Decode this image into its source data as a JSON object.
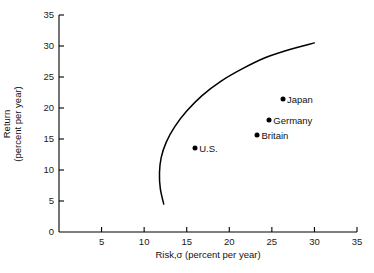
{
  "chart_data": {
    "type": "scatter",
    "title": "",
    "xlabel": "Risk,σ (percent per year)",
    "ylabel_line1": "Return",
    "ylabel_line2": "(percent per year)",
    "xlim": [
      0,
      35
    ],
    "ylim": [
      0,
      35
    ],
    "xticks": [
      5,
      10,
      15,
      20,
      25,
      30,
      35
    ],
    "yticks": [
      0,
      5,
      10,
      15,
      20,
      25,
      30,
      35
    ],
    "xtick_labels": [
      "5",
      "10",
      "15",
      "20",
      "25",
      "30",
      "35"
    ],
    "ytick_labels": [
      "0",
      "5",
      "10",
      "15",
      "20",
      "25",
      "30",
      "35"
    ],
    "grid": false,
    "legend": "none",
    "points": [
      {
        "label": "U.S.",
        "x": 16.0,
        "y": 13.5,
        "label_side": "right"
      },
      {
        "label": "Britain",
        "x": 23.3,
        "y": 15.7,
        "label_side": "right"
      },
      {
        "label": "Germany",
        "x": 24.7,
        "y": 18.0,
        "label_side": "right"
      },
      {
        "label": "Japan",
        "x": 26.3,
        "y": 21.5,
        "label_side": "right"
      }
    ],
    "series": [
      {
        "name": "efficient-frontier",
        "type": "line",
        "color": "#000000",
        "x": [
          12.3,
          11.9,
          11.8,
          12.0,
          12.6,
          13.6,
          15.0,
          16.8,
          19.0,
          21.5,
          24.2,
          27.0,
          30.0
        ],
        "y": [
          4.5,
          7.0,
          9.5,
          12.0,
          14.5,
          17.0,
          19.5,
          22.0,
          24.3,
          26.3,
          28.1,
          29.4,
          30.5
        ]
      }
    ]
  },
  "axes": {
    "x_axis_color": "#000000",
    "y_axis_color": "#000000"
  }
}
